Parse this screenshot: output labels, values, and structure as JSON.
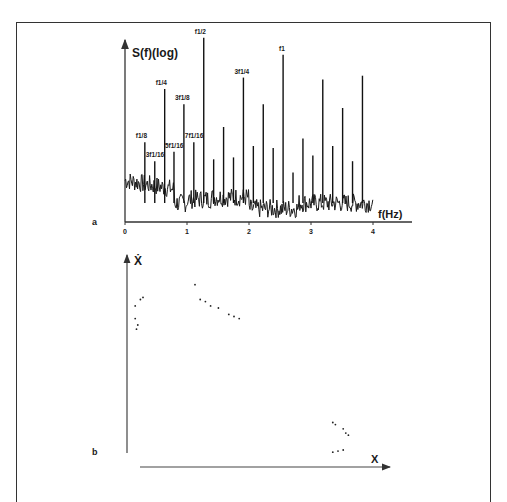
{
  "figure": {
    "panel_labels": [
      "a",
      "b"
    ]
  },
  "chart_data": [
    {
      "type": "line",
      "panel": "a",
      "title": "",
      "ylabel": "S(f)(log)",
      "xlabel": "f(Hz)",
      "x_ticks": [
        "0",
        "1",
        "2",
        "3",
        "4"
      ],
      "xlim": [
        0,
        4.3
      ],
      "ylim": [
        0,
        1
      ],
      "grid": false,
      "description": "Power spectrum (log scale) showing subharmonic peaks",
      "peaks": [
        {
          "label": "f1/8",
          "label_text": "f1/8",
          "freq": 0.32,
          "height": 0.42
        },
        {
          "label": "3f1/16",
          "label_text": "3f1/16",
          "freq": 0.48,
          "height": 0.32
        },
        {
          "label": "f1/4",
          "label_text": "f1/4",
          "freq": 0.64,
          "height": 0.7
        },
        {
          "label": "5f1/16",
          "label_text": "5f1/16",
          "freq": 0.79,
          "height": 0.37
        },
        {
          "label": "3f1/8",
          "label_text": "3f1/8",
          "freq": 0.95,
          "height": 0.62
        },
        {
          "label": "7f1/16",
          "label_text": "7f1/16",
          "freq": 1.11,
          "height": 0.42
        },
        {
          "label": "f1/2",
          "label_text": "f1/2",
          "freq": 1.27,
          "height": 0.97
        },
        {
          "label": "",
          "label_text": "",
          "freq": 1.43,
          "height": 0.33
        },
        {
          "label": "",
          "label_text": "",
          "freq": 1.59,
          "height": 0.5
        },
        {
          "label": "",
          "label_text": "",
          "freq": 1.75,
          "height": 0.34
        },
        {
          "label": "3f1/4",
          "label_text": "3f1/4",
          "freq": 1.91,
          "height": 0.76
        },
        {
          "label": "",
          "label_text": "",
          "freq": 2.07,
          "height": 0.4
        },
        {
          "label": "",
          "label_text": "",
          "freq": 2.23,
          "height": 0.62
        },
        {
          "label": "",
          "label_text": "",
          "freq": 2.39,
          "height": 0.39
        },
        {
          "label": "f1",
          "label_text": "f1",
          "freq": 2.55,
          "height": 0.88
        },
        {
          "label": "",
          "label_text": "",
          "freq": 2.71,
          "height": 0.26
        },
        {
          "label": "",
          "label_text": "",
          "freq": 2.87,
          "height": 0.44
        },
        {
          "label": "",
          "label_text": "",
          "freq": 3.03,
          "height": 0.35
        },
        {
          "label": "",
          "label_text": "",
          "freq": 3.19,
          "height": 0.75
        },
        {
          "label": "",
          "label_text": "",
          "freq": 3.35,
          "height": 0.4
        },
        {
          "label": "",
          "label_text": "",
          "freq": 3.51,
          "height": 0.6
        },
        {
          "label": "",
          "label_text": "",
          "freq": 3.67,
          "height": 0.32
        },
        {
          "label": "",
          "label_text": "",
          "freq": 3.83,
          "height": 0.77
        }
      ],
      "noise_floor": 0.12
    },
    {
      "type": "scatter",
      "panel": "b",
      "title": "",
      "xlabel": "X",
      "ylabel": "Ẋ",
      "grid": false,
      "xlim": [
        0,
        1
      ],
      "ylim": [
        0,
        1
      ],
      "description": "Phase portrait (Poincaré-like section) with point clusters",
      "points": [
        {
          "x": 0.02,
          "y": 0.76
        },
        {
          "x": 0.04,
          "y": 0.79
        },
        {
          "x": 0.05,
          "y": 0.8
        },
        {
          "x": 0.02,
          "y": 0.7
        },
        {
          "x": 0.03,
          "y": 0.67
        },
        {
          "x": 0.025,
          "y": 0.65
        },
        {
          "x": 0.27,
          "y": 0.79
        },
        {
          "x": 0.29,
          "y": 0.78
        },
        {
          "x": 0.31,
          "y": 0.76
        },
        {
          "x": 0.34,
          "y": 0.75
        },
        {
          "x": 0.38,
          "y": 0.72
        },
        {
          "x": 0.4,
          "y": 0.71
        },
        {
          "x": 0.42,
          "y": 0.7
        },
        {
          "x": 0.25,
          "y": 0.86
        },
        {
          "x": 0.78,
          "y": 0.21
        },
        {
          "x": 0.79,
          "y": 0.2
        },
        {
          "x": 0.82,
          "y": 0.18
        },
        {
          "x": 0.83,
          "y": 0.16
        },
        {
          "x": 0.84,
          "y": 0.15
        },
        {
          "x": 0.78,
          "y": 0.07
        },
        {
          "x": 0.8,
          "y": 0.075
        },
        {
          "x": 0.82,
          "y": 0.08
        }
      ]
    }
  ]
}
